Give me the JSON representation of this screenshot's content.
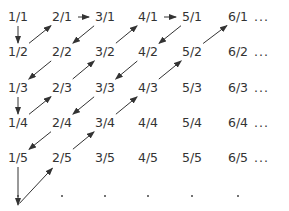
{
  "diagram": {
    "colors": {
      "text": "#333333",
      "arrow": "#333333",
      "background": "#ffffff"
    },
    "columns_x": [
      18,
      62,
      105,
      148,
      192,
      238
    ],
    "rows_y": [
      17,
      52,
      88,
      123,
      158
    ],
    "dots_y": 195,
    "ellipsis": "...",
    "grid": [
      [
        "1/1",
        "2/1",
        "3/1",
        "4/1",
        "5/1",
        "6/1"
      ],
      [
        "1/2",
        "2/2",
        "3/2",
        "4/2",
        "5/2",
        "6/2"
      ],
      [
        "1/3",
        "2/3",
        "3/3",
        "4/3",
        "5/3",
        "6/3"
      ],
      [
        "1/4",
        "2/4",
        "3/4",
        "4/4",
        "5/4",
        "6/4"
      ],
      [
        "1/5",
        "2/5",
        "3/5",
        "4/5",
        "5/5",
        "6/5"
      ]
    ],
    "path": [
      "1/1",
      "1/2",
      "2/1",
      "3/1",
      "2/2",
      "1/3",
      "1/4",
      "2/3",
      "3/2",
      "4/1",
      "5/1",
      "4/2",
      "3/3",
      "2/4",
      "1/5",
      "(below)",
      "2/5",
      "3/4",
      "4/3",
      "5/2",
      "6/1"
    ],
    "arrows": [
      {
        "from": [
          0,
          0
        ],
        "to": [
          0,
          1
        ]
      },
      {
        "from": [
          0,
          1
        ],
        "to": [
          1,
          0
        ]
      },
      {
        "from": [
          1,
          0
        ],
        "to": [
          2,
          0
        ]
      },
      {
        "from": [
          2,
          0
        ],
        "to": [
          1,
          1
        ]
      },
      {
        "from": [
          1,
          1
        ],
        "to": [
          0,
          2
        ]
      },
      {
        "from": [
          0,
          2
        ],
        "to": [
          0,
          3
        ]
      },
      {
        "from": [
          0,
          3
        ],
        "to": [
          1,
          2
        ]
      },
      {
        "from": [
          1,
          2
        ],
        "to": [
          2,
          1
        ]
      },
      {
        "from": [
          2,
          1
        ],
        "to": [
          3,
          0
        ]
      },
      {
        "from": [
          3,
          0
        ],
        "to": [
          4,
          0
        ]
      },
      {
        "from": [
          4,
          0
        ],
        "to": [
          3,
          1
        ]
      },
      {
        "from": [
          3,
          1
        ],
        "to": [
          2,
          2
        ]
      },
      {
        "from": [
          2,
          2
        ],
        "to": [
          1,
          3
        ]
      },
      {
        "from": [
          1,
          3
        ],
        "to": [
          0,
          4
        ]
      },
      {
        "from": [
          0,
          4
        ],
        "to": [
          0,
          5
        ]
      },
      {
        "from": [
          0,
          5
        ],
        "to": [
          1,
          4
        ]
      },
      {
        "from": [
          1,
          4
        ],
        "to": [
          2,
          3
        ]
      },
      {
        "from": [
          2,
          3
        ],
        "to": [
          3,
          2
        ]
      },
      {
        "from": [
          3,
          2
        ],
        "to": [
          4,
          1
        ]
      },
      {
        "from": [
          4,
          1
        ],
        "to": [
          5,
          0
        ]
      }
    ]
  }
}
